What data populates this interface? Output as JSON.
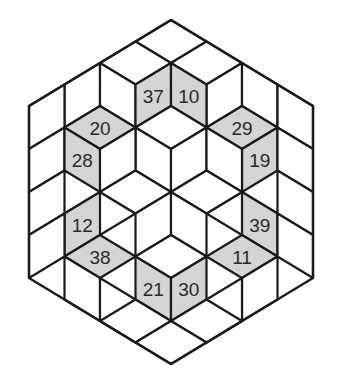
{
  "diagram": {
    "type": "rhombus-tiling-hexagon-puzzle",
    "colors": {
      "shaded": "#d4d4d4",
      "blank": "#ffffff",
      "stroke": "#1a1a1a",
      "text": "#2a2a2a"
    },
    "grid": {
      "x0": 29,
      "dx": 35.5,
      "y0": 20,
      "dy": 21.5
    },
    "outline": [
      [
        4,
        0
      ],
      [
        8,
        4
      ],
      [
        8,
        12
      ],
      [
        4,
        16
      ],
      [
        0,
        12
      ],
      [
        0,
        4
      ]
    ],
    "rhombi": [
      {
        "t": "T",
        "p": [
          4,
          0
        ]
      },
      {
        "t": "T",
        "p": [
          3,
          1
        ]
      },
      {
        "t": "T",
        "p": [
          5,
          1
        ]
      },
      {
        "t": "R",
        "p": [
          2,
          2
        ]
      },
      {
        "t": "L",
        "p": [
          2,
          2
        ]
      },
      {
        "t": "R",
        "p": [
          6,
          2
        ]
      },
      {
        "t": "L",
        "p": [
          6,
          2
        ]
      },
      {
        "t": "R",
        "p": [
          4,
          2
        ],
        "label": "37",
        "shaded": true
      },
      {
        "t": "L",
        "p": [
          4,
          2
        ],
        "label": "10",
        "shaded": true
      },
      {
        "t": "R",
        "p": [
          1,
          3
        ]
      },
      {
        "t": "L",
        "p": [
          7,
          3
        ]
      },
      {
        "t": "T",
        "p": [
          2,
          4
        ],
        "label": "20",
        "shaded": true
      },
      {
        "t": "T",
        "p": [
          6,
          4
        ],
        "label": "29",
        "shaded": true
      },
      {
        "t": "T",
        "p": [
          4,
          4
        ]
      },
      {
        "t": "R",
        "p": [
          1,
          5
        ]
      },
      {
        "t": "L",
        "p": [
          1,
          5
        ],
        "label": "28",
        "shaded": true
      },
      {
        "t": "L",
        "p": [
          3,
          5
        ]
      },
      {
        "t": "R",
        "p": [
          5,
          5
        ]
      },
      {
        "t": "R",
        "p": [
          7,
          5
        ],
        "label": "19",
        "shaded": true
      },
      {
        "t": "L",
        "p": [
          7,
          5
        ]
      },
      {
        "t": "R",
        "p": [
          3,
          5
        ]
      },
      {
        "t": "L",
        "p": [
          5,
          5
        ]
      },
      {
        "t": "T",
        "p": [
          2,
          8
        ]
      },
      {
        "t": "T",
        "p": [
          6,
          8
        ]
      },
      {
        "t": "R",
        "p": [
          1,
          7
        ]
      },
      {
        "t": "L",
        "p": [
          7,
          7
        ]
      },
      {
        "t": "T",
        "p": [
          3,
          7
        ]
      },
      {
        "t": "T",
        "p": [
          5,
          7
        ]
      },
      {
        "t": "R",
        "p": [
          4,
          8
        ]
      },
      {
        "t": "L",
        "p": [
          4,
          8
        ]
      },
      {
        "t": "R",
        "p": [
          2,
          8
        ],
        "label": "12",
        "shaded": true
      },
      {
        "t": "L",
        "p": [
          6,
          8
        ],
        "label": "39",
        "shaded": true
      },
      {
        "t": "R",
        "p": [
          1,
          9
        ]
      },
      {
        "t": "L",
        "p": [
          7,
          9
        ]
      },
      {
        "t": "T",
        "p": [
          2,
          10
        ],
        "label": "38",
        "shaded": true
      },
      {
        "t": "T",
        "p": [
          6,
          10
        ],
        "label": "11",
        "shaded": true
      },
      {
        "t": "T",
        "p": [
          4,
          10
        ]
      },
      {
        "t": "L",
        "p": [
          1,
          11
        ]
      },
      {
        "t": "R",
        "p": [
          7,
          11
        ]
      },
      {
        "t": "L",
        "p": [
          3,
          11
        ],
        "label": "21",
        "shaded": true
      },
      {
        "t": "R",
        "p": [
          5,
          11
        ],
        "label": "30",
        "shaded": true
      },
      {
        "t": "L",
        "p": [
          2,
          12
        ]
      },
      {
        "t": "R",
        "p": [
          6,
          12
        ]
      },
      {
        "t": "T",
        "p": [
          3,
          13
        ]
      },
      {
        "t": "T",
        "p": [
          5,
          13
        ]
      },
      {
        "t": "T",
        "p": [
          4,
          14
        ]
      }
    ],
    "labels": [
      "37",
      "10",
      "20",
      "29",
      "28",
      "19",
      "12",
      "39",
      "38",
      "11",
      "21",
      "30"
    ]
  }
}
